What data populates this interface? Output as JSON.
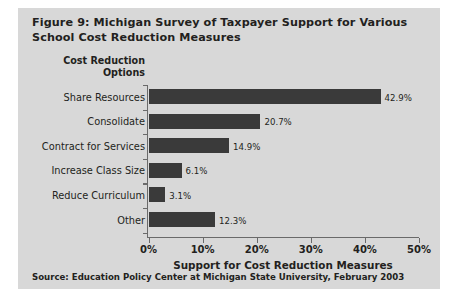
{
  "figure": {
    "title": "Figure 9: Michigan Survey of Taxpayer Support for Various School Cost Reduction Measures",
    "source": "Source: Education Policy Center at Michigan State University, February 2003",
    "panel_color": "#d8d8d8",
    "bar_color": "#3a3a3a",
    "text_color": "#231f20",
    "axis_color": "#6a6a6a"
  },
  "chart_data": {
    "type": "bar",
    "orientation": "horizontal",
    "title": "Figure 9: Michigan Survey of Taxpayer Support for Various School Cost Reduction Measures",
    "category_axis_title": "Cost Reduction Options",
    "xlabel": "Support for Cost Reduction Measures",
    "ylabel": "Cost Reduction Options",
    "categories": [
      "Share Resources",
      "Consolidate",
      "Contract for Services",
      "Increase Class Size",
      "Reduce Curriculum",
      "Other"
    ],
    "values": [
      42.9,
      20.7,
      14.9,
      6.1,
      3.1,
      12.3
    ],
    "value_labels": [
      "42.9%",
      "20.7%",
      "14.9%",
      "6.1%",
      "3.1%",
      "12.3%"
    ],
    "xlim": [
      0,
      50
    ],
    "xticks": [
      0,
      10,
      20,
      30,
      40,
      50
    ],
    "xtick_labels": [
      "0%",
      "10%",
      "20%",
      "30%",
      "40%",
      "50%"
    ],
    "grid": false,
    "legend": false
  }
}
